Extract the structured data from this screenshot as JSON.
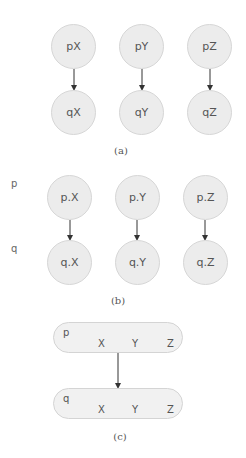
{
  "panel_a": {
    "caption": "(a)",
    "top": [
      "pX",
      "pY",
      "pZ"
    ],
    "bottom": [
      "qX",
      "qY",
      "qZ"
    ]
  },
  "panel_b": {
    "caption": "(b)",
    "row_labels": [
      "p",
      "q"
    ],
    "top": [
      "p.X",
      "p.Y",
      "p.Z"
    ],
    "bottom": [
      "q.X",
      "q.Y",
      "q.Z"
    ]
  },
  "panel_c": {
    "caption": "(c)",
    "top": {
      "name": "p",
      "fields": [
        "X",
        "Y",
        "Z"
      ]
    },
    "bottom": {
      "name": "q",
      "fields": [
        "X",
        "Y",
        "Z"
      ]
    }
  },
  "colors": {
    "node_fill": "#ececec",
    "node_stroke": "#d6d6d6",
    "text": "#555555",
    "arrow": "#333333"
  }
}
